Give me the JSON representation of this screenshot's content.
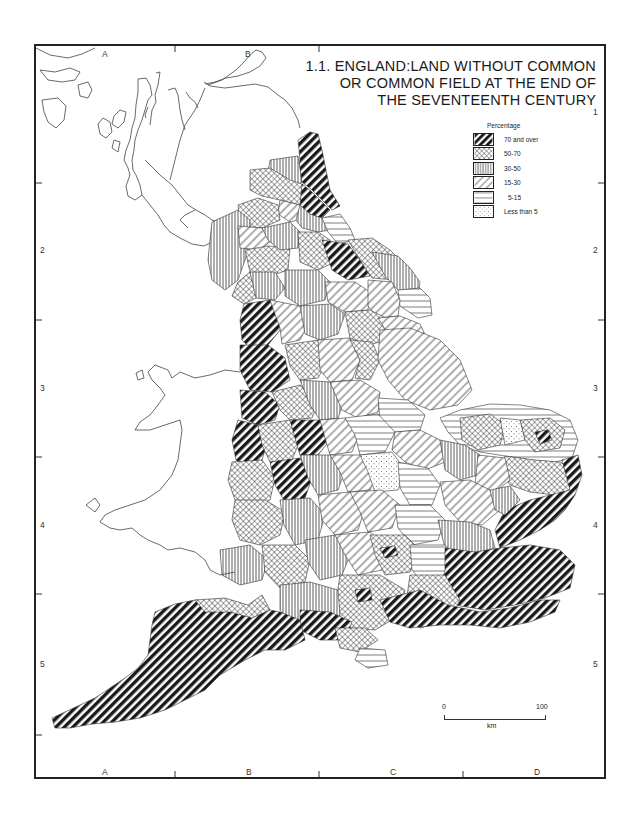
{
  "map": {
    "title_lines": [
      "1.1. ENGLAND:LAND WITHOUT COMMON",
      "OR COMMON FIELD AT THE END OF",
      "THE SEVENTEENTH CENTURY"
    ],
    "grid": {
      "columns_top": [
        "A",
        "B"
      ],
      "columns_bottom": [
        "A",
        "B",
        "C",
        "D"
      ],
      "rows_left": [
        "2",
        "3",
        "4",
        "5"
      ],
      "rows_right": [
        "1",
        "2",
        "3",
        "4",
        "5"
      ]
    },
    "legend": {
      "title": "Percentage",
      "items": [
        {
          "label": "70 and over",
          "pattern": "dense-diagonal-black"
        },
        {
          "label": "50-70",
          "pattern": "crosshatch"
        },
        {
          "label": "30-50",
          "pattern": "vertical-lines"
        },
        {
          "label": "15-30",
          "pattern": "wide-diagonal"
        },
        {
          "label": "5-15",
          "pattern": "horizontal-lines"
        },
        {
          "label": "Less than 5",
          "pattern": "dots"
        }
      ]
    },
    "scale_bar": {
      "start": "0",
      "end": "100",
      "unit": "km"
    },
    "colors": {
      "ink": "#1a1a1a",
      "paper": "#ffffff"
    }
  }
}
